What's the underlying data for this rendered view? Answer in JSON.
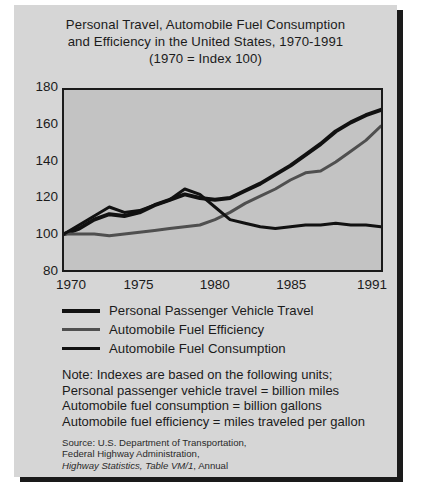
{
  "title": {
    "line1": "Personal Travel, Automobile Fuel Consumption",
    "line2": "and Efficiency in the United States, 1970-1991",
    "line3": "(1970 = Index 100)"
  },
  "legend": [
    {
      "label": "Personal Passenger Vehicle Travel",
      "color": "#111111",
      "width": 4
    },
    {
      "label": "Automobile Fuel Efficiency",
      "color": "#4f4f4f",
      "width": 3
    },
    {
      "label": "Automobile Fuel Consumption",
      "color": "#111111",
      "width": 3
    }
  ],
  "note": {
    "line1": "Note: Indexes are based on the following units;",
    "line2": "Personal passenger vehicle travel = billion miles",
    "line3": "Automobile fuel consumption = billion gallons",
    "line4": "Automobile fuel efficiency = miles traveled per gallon"
  },
  "source": {
    "line1": "Source: U.S. Department of Transportation,",
    "line2": "Federal Highway Administration,",
    "line3_italic": "Highway Statistics, Table VM/1",
    "line3_rest": ", Annual"
  },
  "chart_data": {
    "type": "line",
    "title": "Personal Travel, Automobile Fuel Consumption and Efficiency in the United States, 1970-1991",
    "subtitle": "(1970 = Index 100)",
    "xlabel": "",
    "ylabel": "",
    "grid": false,
    "legend_position": "below",
    "xlim": [
      1970,
      1991
    ],
    "ylim": [
      80,
      180
    ],
    "yticks": [
      80,
      100,
      120,
      140,
      160,
      180
    ],
    "xticks": [
      1970,
      1975,
      1980,
      1985,
      1991
    ],
    "x": [
      1970,
      1971,
      1972,
      1973,
      1974,
      1975,
      1976,
      1977,
      1978,
      1979,
      1980,
      1981,
      1982,
      1983,
      1984,
      1985,
      1986,
      1987,
      1988,
      1989,
      1990,
      1991
    ],
    "series": [
      {
        "name": "Personal Passenger Vehicle Travel",
        "color": "#111111",
        "width": 4,
        "values": [
          100,
          103,
          108,
          111,
          110,
          112,
          116,
          119,
          122,
          120,
          119,
          120,
          124,
          128,
          133,
          138,
          144,
          150,
          157,
          162,
          166,
          169
        ]
      },
      {
        "name": "Automobile Fuel Efficiency",
        "color": "#4f4f4f",
        "width": 3,
        "values": [
          100,
          100,
          100,
          99,
          100,
          101,
          102,
          103,
          104,
          105,
          108,
          112,
          117,
          121,
          125,
          130,
          134,
          135,
          140,
          146,
          152,
          160
        ]
      },
      {
        "name": "Automobile Fuel Consumption",
        "color": "#111111",
        "width": 3,
        "values": [
          100,
          105,
          110,
          115,
          112,
          113,
          116,
          119,
          125,
          122,
          115,
          108,
          106,
          104,
          103,
          104,
          105,
          105,
          106,
          105,
          105,
          104
        ]
      }
    ]
  }
}
